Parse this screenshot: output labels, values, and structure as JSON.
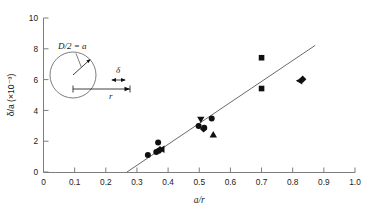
{
  "chart_data": {
    "type": "scatter",
    "title": "",
    "xlabel": "a/r",
    "ylabel": "δ/a (×10⁻³)",
    "xlim": [
      0,
      1.0
    ],
    "ylim": [
      0,
      10
    ],
    "grid": false,
    "legend": "none",
    "xticks": [
      "0",
      "0.1",
      "0.2",
      "0.3",
      "0.4",
      "0.5",
      "0.6",
      "0.7",
      "0.8",
      "0.9",
      "1.0"
    ],
    "xtick_values": [
      0,
      0.1,
      0.2,
      0.3,
      0.4,
      0.5,
      0.6,
      0.7,
      0.8,
      0.9,
      1.0
    ],
    "yticks": [
      "0",
      "2",
      "4",
      "6",
      "8",
      "10"
    ],
    "ytick_values": [
      0,
      2,
      4,
      6,
      8,
      10
    ],
    "points": [
      {
        "x": 0.335,
        "y": 1.1,
        "marker": "circle"
      },
      {
        "x": 0.368,
        "y": 1.92,
        "marker": "circle"
      },
      {
        "x": 0.362,
        "y": 1.3,
        "marker": "circle"
      },
      {
        "x": 0.374,
        "y": 1.45,
        "marker": "diamond"
      },
      {
        "x": 0.38,
        "y": 1.48,
        "marker": "triangle-left"
      },
      {
        "x": 0.37,
        "y": 1.38,
        "marker": "circle"
      },
      {
        "x": 0.498,
        "y": 2.98,
        "marker": "circle"
      },
      {
        "x": 0.505,
        "y": 3.42,
        "marker": "triangle-down"
      },
      {
        "x": 0.514,
        "y": 2.8,
        "marker": "diamond"
      },
      {
        "x": 0.516,
        "y": 2.88,
        "marker": "circle"
      },
      {
        "x": 0.54,
        "y": 3.48,
        "marker": "circle"
      },
      {
        "x": 0.545,
        "y": 2.42,
        "marker": "triangle-up"
      },
      {
        "x": 0.7,
        "y": 7.42,
        "marker": "square"
      },
      {
        "x": 0.7,
        "y": 5.42,
        "marker": "square"
      },
      {
        "x": 0.822,
        "y": 5.92,
        "marker": "triangle-left"
      },
      {
        "x": 0.832,
        "y": 6.02,
        "marker": "diamond"
      }
    ],
    "fit_line": {
      "x_start": 0.268,
      "y_start": 0.0,
      "x_end": 0.872,
      "y_end": 8.22,
      "style": "solid"
    }
  },
  "inset": {
    "name": "capillary-cross-section-diagram",
    "radius_label": "D/2 = a",
    "gap_label": "δ",
    "distance_label": "r"
  }
}
